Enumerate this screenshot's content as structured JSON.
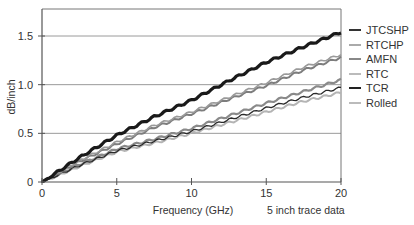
{
  "chart_data": {
    "type": "line",
    "title": "",
    "xlabel": "Frequency (GHz)",
    "ylabel": "dB/inch",
    "annotation": "5 inch trace data",
    "xlim": [
      0,
      20
    ],
    "ylim": [
      0,
      1.77
    ],
    "x_ticks": [
      0,
      5,
      10,
      15,
      20
    ],
    "y_ticks": [
      0,
      0.5,
      1.0,
      1.5
    ],
    "x_tick_labels": [
      "0",
      "5",
      "10",
      "15",
      "20"
    ],
    "y_tick_labels": [
      "0",
      "0.5",
      "1.0",
      "1.5"
    ],
    "grid": "horizontal",
    "legend_position": "right",
    "x": [
      0,
      2.5,
      5,
      7.5,
      10,
      12.5,
      15,
      17.5,
      20
    ],
    "series": [
      {
        "name": "JTCSHP",
        "color": "#1a1a1a",
        "width": 3.2,
        "values": [
          0,
          0.25,
          0.48,
          0.67,
          0.84,
          1.04,
          1.23,
          1.39,
          1.54
        ]
      },
      {
        "name": "RTCHP",
        "color": "#9a9a9a",
        "width": 1.6,
        "values": [
          0,
          0.22,
          0.41,
          0.58,
          0.72,
          0.87,
          1.02,
          1.18,
          1.31
        ]
      },
      {
        "name": "AMFN",
        "color": "#7d7d7d",
        "width": 2.0,
        "values": [
          0,
          0.21,
          0.39,
          0.56,
          0.7,
          0.85,
          0.99,
          1.15,
          1.28
        ]
      },
      {
        "name": "RTC",
        "color": "#8a8a8a",
        "width": 2.2,
        "values": [
          0,
          0.18,
          0.34,
          0.44,
          0.55,
          0.68,
          0.81,
          0.93,
          1.05
        ]
      },
      {
        "name": "TCR",
        "color": "#2a2a2a",
        "width": 1.3,
        "values": [
          0,
          0.17,
          0.32,
          0.42,
          0.52,
          0.64,
          0.76,
          0.87,
          0.97
        ]
      },
      {
        "name": "Rolled",
        "color": "#b4b4b4",
        "width": 2.0,
        "values": [
          0,
          0.16,
          0.31,
          0.4,
          0.5,
          0.61,
          0.72,
          0.83,
          0.92
        ]
      }
    ]
  },
  "legend": {
    "items": [
      {
        "label": "JTCSHP",
        "color": "#333333"
      },
      {
        "label": "RTCHP",
        "color": "#aaaaaa"
      },
      {
        "label": "AMFN",
        "color": "#888888"
      },
      {
        "label": "RTC",
        "color": "#bbbbbb"
      },
      {
        "label": "TCR",
        "color": "#222222"
      },
      {
        "label": "Rolled",
        "color": "#bbbbbb"
      }
    ]
  }
}
